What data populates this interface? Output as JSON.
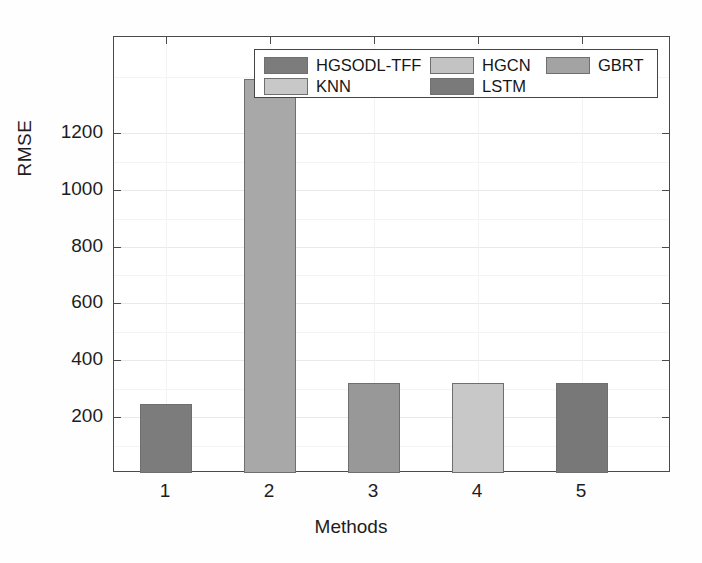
{
  "chart_data": {
    "type": "bar",
    "title": "",
    "xlabel": "Methods",
    "ylabel": "RMSE",
    "categories": [
      "1",
      "2",
      "3",
      "4",
      "5"
    ],
    "values": [
      333,
      1198,
      390,
      390,
      390
    ],
    "series_names": [
      "HGSODL-TFF",
      "HGCN",
      "GBRT",
      "KNN",
      "LSTM"
    ],
    "bar_colors": [
      "#7c7c7c",
      "#a8a8a8",
      "#989898",
      "#c8c8c8",
      "#787878"
    ],
    "ylim": [
      150,
      1310
    ],
    "yticks": [
      200,
      400,
      600,
      800,
      1000,
      1200
    ],
    "ytick_labels": [
      "200",
      "400",
      "600",
      "800",
      "1000",
      "1200"
    ],
    "xticks": [
      "1",
      "2",
      "3",
      "4",
      "5"
    ],
    "grid": true,
    "legend_position": "upper center"
  },
  "legend": {
    "entries": [
      {
        "label": "HGSODL-TFF",
        "color": "#7c7c7c"
      },
      {
        "label": "HGCN",
        "color": "#c3c3c3"
      },
      {
        "label": "GBRT",
        "color": "#a3a3a3"
      },
      {
        "label": "KNN",
        "color": "#c8c8c8"
      },
      {
        "label": "LSTM",
        "color": "#7a7a7a"
      }
    ]
  },
  "axes": {
    "ylabel": "RMSE",
    "xlabel": "Methods",
    "ytick_labels": [
      "1200",
      "1000",
      "800",
      "600",
      "400",
      "200"
    ],
    "xtick_labels": [
      "1",
      "2",
      "3",
      "4",
      "5"
    ]
  }
}
